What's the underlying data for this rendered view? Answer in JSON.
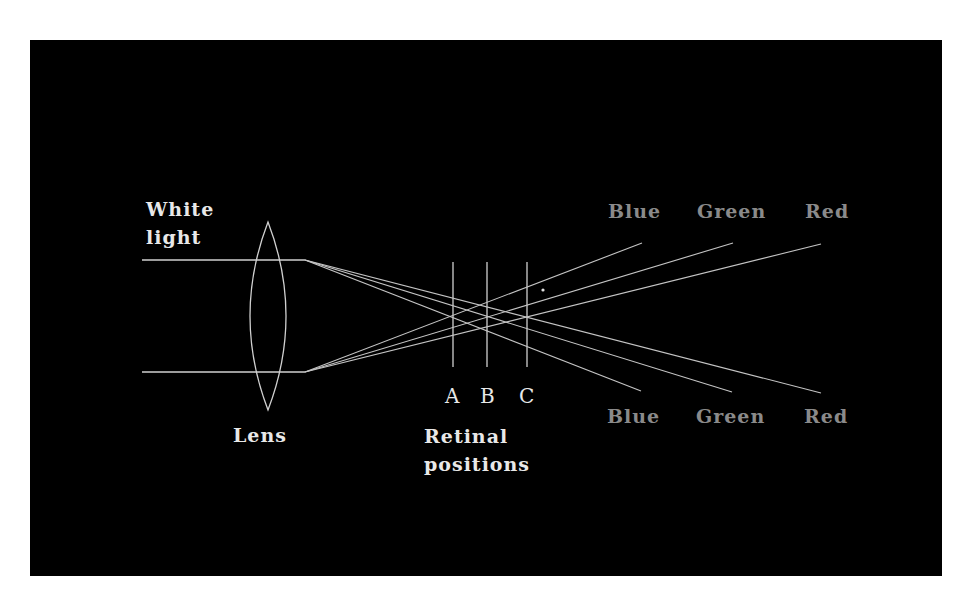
{
  "labels": {
    "white_light_line1": "White",
    "white_light_line2": "light",
    "lens": "Lens",
    "retinal_line1": "Retinal",
    "retinal_line2": "positions",
    "pos_a": "A",
    "pos_b": "B",
    "pos_c": "C",
    "top_blue": "Blue",
    "top_green": "Green",
    "top_red": "Red",
    "bottom_blue": "Blue",
    "bottom_green": "Green",
    "bottom_red": "Red"
  },
  "colors": {
    "background": "#000000",
    "line": "#cfcfcf",
    "primary_text": "#e8e8e8",
    "color_label_text": "#8a8a8a"
  },
  "geometry": {
    "incoming_rays": [
      {
        "x1": 142,
        "y1": 260,
        "x2": 305,
        "y2": 260
      },
      {
        "x1": 142,
        "y1": 372,
        "x2": 305,
        "y2": 372
      }
    ],
    "lens": {
      "cx": 268,
      "top": 222,
      "bottom": 410,
      "half_width": 18
    },
    "retinal_lines": [
      {
        "name": "A",
        "x": 453,
        "y1": 262,
        "y2": 367
      },
      {
        "name": "B",
        "x": 487,
        "y1": 262,
        "y2": 367
      },
      {
        "name": "C",
        "x": 527,
        "y1": 262,
        "y2": 367
      }
    ],
    "refracted_rays": [
      {
        "color": "Blue",
        "from": [
          305,
          260
        ],
        "to": [
          641,
          391
        ]
      },
      {
        "color": "Green",
        "from": [
          305,
          260
        ],
        "to": [
          732,
          392
        ]
      },
      {
        "color": "Red",
        "from": [
          305,
          260
        ],
        "to": [
          821,
          393
        ]
      },
      {
        "color": "Blue",
        "from": [
          305,
          372
        ],
        "to": [
          642,
          243
        ]
      },
      {
        "color": "Green",
        "from": [
          305,
          372
        ],
        "to": [
          733,
          243
        ]
      },
      {
        "color": "Red",
        "from": [
          305,
          372
        ],
        "to": [
          821,
          244
        ]
      }
    ]
  }
}
